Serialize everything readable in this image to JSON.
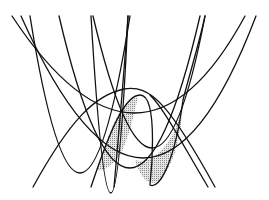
{
  "diagram": {
    "title": "",
    "colors": {
      "stroke": "#111111",
      "shade": "#bdbdbd",
      "background": "#ffffff"
    },
    "curves": [
      {
        "id": "parabola-wide",
        "d": "M12,16 Q140,210 245,16"
      },
      {
        "id": "parabola-2",
        "d": "M21,16 Q148,300 256,16"
      },
      {
        "id": "parabola-3",
        "d": "M30,16 Q80,330 130,16"
      },
      {
        "id": "parabola-4",
        "d": "M59,16 Q130,320 200,16"
      },
      {
        "id": "parabola-5",
        "d": "M91,16 Q112,370 128,16"
      },
      {
        "id": "parabola-6",
        "d": "M93,16 Q155,280 205,16"
      },
      {
        "id": "line-left",
        "d": "M33,187 C70,120 95,95 124,89 C150,84 170,105 215,187"
      },
      {
        "id": "wave",
        "d": "M91,187 C110,130 125,95 140,95 C160,95 150,185 150,185 C160,190 175,160 183,100 C188,80 200,40 205,16"
      },
      {
        "id": "steep-right",
        "d": "M208,187 C180,140 165,110 150,95"
      },
      {
        "id": "steep-right-2",
        "d": "M114,187 C120,120 125,60 128,16"
      }
    ],
    "shaded_regions": [
      {
        "id": "shade-left",
        "d": "M97,170 C103,150 110,130 118,115 C125,104 132,98 138,97 C134,115 128,140 120,155 C112,165 104,172 97,170 Z"
      },
      {
        "id": "shade-right",
        "d": "M135,160 C150,165 165,150 175,130 C180,118 182,108 183,100 C182,125 178,160 160,180 C150,188 140,178 135,160 Z"
      }
    ]
  }
}
